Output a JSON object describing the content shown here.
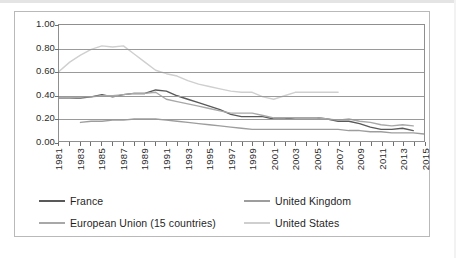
{
  "chart_data": {
    "type": "line",
    "title": "",
    "subtitle": "",
    "xlabel": "",
    "ylabel": "",
    "xlim": [
      1981,
      2015
    ],
    "ylim": [
      0.0,
      1.0
    ],
    "grid": true,
    "legend_position": "bottom",
    "y_ticks": [
      "1.00",
      "0.80",
      "0.60",
      "0.40",
      "0.20",
      "0.00"
    ],
    "y_tick_values": [
      1.0,
      0.8,
      0.6,
      0.4,
      0.2,
      0.0
    ],
    "x_tick_labels": [
      "1981",
      "1983",
      "1985",
      "1987",
      "1989",
      "1991",
      "1993",
      "1995",
      "1997",
      "1999",
      "2001",
      "2003",
      "2005",
      "2007",
      "2009",
      "2011",
      "2013",
      "2015"
    ],
    "x_tick_values": [
      1981,
      1983,
      1985,
      1987,
      1989,
      1991,
      1993,
      1995,
      1997,
      1999,
      2001,
      2003,
      2005,
      2007,
      2009,
      2011,
      2013,
      2015
    ],
    "x_all_years": [
      1981,
      1982,
      1983,
      1984,
      1985,
      1986,
      1987,
      1988,
      1989,
      1990,
      1991,
      1992,
      1993,
      1994,
      1995,
      1996,
      1997,
      1998,
      1999,
      2000,
      2001,
      2002,
      2003,
      2004,
      2005,
      2006,
      2007,
      2008,
      2009,
      2010,
      2011,
      2012,
      2013,
      2014,
      2015
    ],
    "series": [
      {
        "name": "France",
        "color": "#595959",
        "x": [
          1981,
          1982,
          1983,
          1984,
          1985,
          1986,
          1987,
          1988,
          1989,
          1990,
          1991,
          1992,
          1993,
          1994,
          1995,
          1996,
          1997,
          1998,
          1999,
          2000,
          2001,
          2002,
          2003,
          2004,
          2005,
          2006,
          2007,
          2008,
          2009,
          2010,
          2011,
          2012,
          2013,
          2014
        ],
        "values": [
          0.37,
          0.37,
          0.37,
          0.38,
          0.4,
          0.38,
          0.4,
          0.41,
          0.41,
          0.44,
          0.43,
          0.39,
          0.36,
          0.33,
          0.3,
          0.27,
          0.23,
          0.21,
          0.21,
          0.21,
          0.19,
          0.19,
          0.2,
          0.2,
          0.2,
          0.19,
          0.17,
          0.17,
          0.15,
          0.12,
          0.1,
          0.1,
          0.11,
          0.09
        ]
      },
      {
        "name": "United Kingdom",
        "color": "#9d9d9d",
        "x": [
          1983,
          1984,
          1985,
          1986,
          1987,
          1988,
          1989,
          1990,
          1991,
          1992,
          1993,
          1994,
          1995,
          1996,
          1997,
          1998,
          1999,
          2000,
          2001,
          2002,
          2003,
          2004,
          2005,
          2006,
          2007,
          2008,
          2009,
          2010,
          2011,
          2012,
          2013,
          2014,
          2015
        ],
        "values": [
          0.16,
          0.17,
          0.17,
          0.18,
          0.18,
          0.19,
          0.19,
          0.19,
          0.18,
          0.17,
          0.16,
          0.15,
          0.14,
          0.13,
          0.12,
          0.11,
          0.1,
          0.1,
          0.1,
          0.1,
          0.1,
          0.1,
          0.1,
          0.1,
          0.1,
          0.09,
          0.09,
          0.08,
          0.08,
          0.07,
          0.07,
          0.07,
          0.06
        ]
      },
      {
        "name": "European Union (15 countries)",
        "color": "#a8a8a8",
        "x": [
          1981,
          1982,
          1983,
          1984,
          1985,
          1986,
          1987,
          1988,
          1989,
          1990,
          1991,
          1992,
          1993,
          1994,
          1995,
          1996,
          1997,
          1998,
          1999,
          2000,
          2001,
          2002,
          2003,
          2004,
          2005,
          2006,
          2007,
          2008,
          2009,
          2010,
          2011,
          2012,
          2013,
          2014
        ],
        "values": [
          0.37,
          0.37,
          0.38,
          0.38,
          0.39,
          0.39,
          0.4,
          0.41,
          0.41,
          0.42,
          0.36,
          0.34,
          0.32,
          0.3,
          0.28,
          0.26,
          0.24,
          0.24,
          0.24,
          0.22,
          0.2,
          0.2,
          0.2,
          0.2,
          0.2,
          0.19,
          0.18,
          0.19,
          0.17,
          0.16,
          0.14,
          0.13,
          0.14,
          0.13
        ]
      },
      {
        "name": "United States",
        "color": "#cfcfcf",
        "x": [
          1981,
          1982,
          1983,
          1984,
          1985,
          1986,
          1987,
          1988,
          1989,
          1990,
          1991,
          1992,
          1993,
          1994,
          1995,
          1996,
          1997,
          1998,
          1999,
          2000,
          2001,
          2002,
          2003,
          2004,
          2005,
          2006,
          2007
        ],
        "values": [
          0.6,
          0.68,
          0.74,
          0.79,
          0.82,
          0.81,
          0.82,
          0.75,
          0.68,
          0.61,
          0.58,
          0.56,
          0.52,
          0.49,
          0.47,
          0.45,
          0.43,
          0.42,
          0.42,
          0.38,
          0.36,
          0.39,
          0.42,
          0.42,
          0.42,
          0.42,
          0.42
        ]
      }
    ]
  },
  "legend": {
    "items": [
      {
        "label": "France",
        "color": "#595959"
      },
      {
        "label": "United Kingdom",
        "color": "#9d9d9d"
      },
      {
        "label": "European Union (15 countries)",
        "color": "#a8a8a8"
      },
      {
        "label": "United States",
        "color": "#cfcfcf"
      }
    ]
  }
}
